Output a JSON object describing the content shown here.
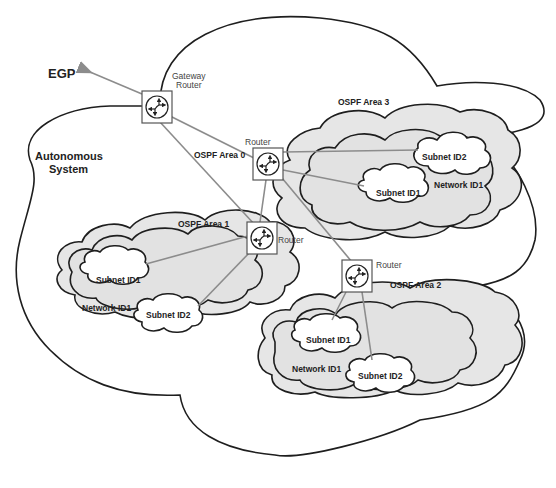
{
  "diagram": {
    "external": {
      "label": "EGP"
    },
    "autonomous_system": {
      "line1": "Autonomous",
      "line2": "System"
    },
    "backbone": {
      "label": "OSPF Area 0"
    },
    "routers": {
      "gateway": {
        "line1": "Gateway",
        "line2": "Router"
      },
      "area3": {
        "label": "Router"
      },
      "area1": {
        "label": "Router"
      },
      "area2": {
        "label": "Router"
      }
    },
    "areas": [
      {
        "label": "OSPF Area 3",
        "network": "Network ID1",
        "subnets": [
          "Subnet ID2",
          "Subnet ID1"
        ]
      },
      {
        "label": "OSPF Area 1",
        "network": "Network ID1",
        "subnets": [
          "Subnet ID1",
          "Subnet ID2"
        ]
      },
      {
        "label": "OSPF Area 2",
        "network": "Network ID1",
        "subnets": [
          "Subnet ID1",
          "Subnet ID2"
        ]
      }
    ],
    "colors": {
      "area_fill": "#e6e6e6",
      "link": "#8c8c8c",
      "outline": "#1e1e1e"
    }
  }
}
